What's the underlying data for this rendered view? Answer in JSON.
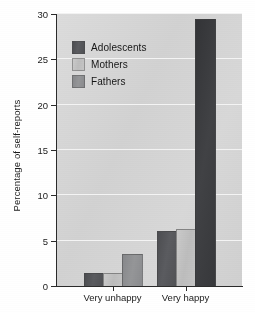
{
  "chart_data": {
    "type": "bar",
    "title": "",
    "xlabel": "",
    "ylabel": "Percentage of self-reports",
    "categories": [
      "Very unhappy",
      "Very happy"
    ],
    "series": [
      {
        "name": "Adolescents",
        "color": "#55565a",
        "values": [
          1.3,
          6.0
        ]
      },
      {
        "name": "Mothers",
        "color": "#c3c3c3",
        "values": [
          1.3,
          6.2
        ]
      },
      {
        "name": "Fathers",
        "color": "#8e8f92",
        "values": [
          3.4,
          29.3
        ]
      }
    ],
    "ylim": [
      0,
      30
    ],
    "yticks": [
      0,
      5,
      10,
      15,
      20,
      25,
      30
    ],
    "ytick_labels": [
      "0",
      "5",
      "10",
      "15",
      "20",
      "25",
      "30"
    ],
    "grid": "horizontal",
    "grid_color": "#f4f4f4",
    "plot_background": "#d6d6d6",
    "legend_position": "top-left-inside"
  },
  "axis": {
    "y_title": "Percentage of self-reports"
  },
  "legend": {
    "items": [
      {
        "label": "Adolescents"
      },
      {
        "label": "Mothers"
      },
      {
        "label": "Fathers"
      }
    ]
  }
}
